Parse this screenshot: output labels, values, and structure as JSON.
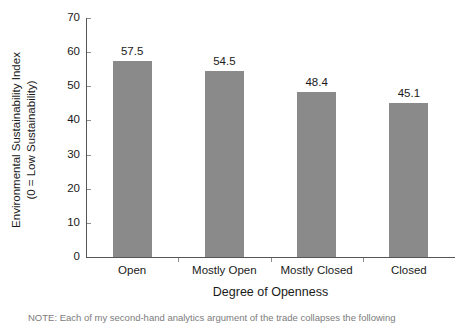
{
  "chart_data": {
    "type": "bar",
    "title": "",
    "categories": [
      "Open",
      "Mostly Open",
      "Mostly Closed",
      "Closed"
    ],
    "values": [
      57.5,
      54.5,
      48.4,
      45.1
    ],
    "value_labels": [
      "57.5",
      "54.5",
      "48.4",
      "45.1"
    ],
    "xlabel": "Degree of Openness",
    "ylabel_line1": "Environmental Sustainability Index",
    "ylabel_line2": "(0 = Low Sustainability)",
    "ylim": [
      0,
      70
    ],
    "yticks": [
      0,
      10,
      20,
      30,
      40,
      50,
      60,
      70
    ],
    "ytick_labels": [
      "0",
      "10",
      "20",
      "30",
      "40",
      "50",
      "60",
      "70"
    ],
    "grid": false,
    "legend": false,
    "bar_color": "#8a8a8a",
    "axis_color": "#555555",
    "background": "#ffffff"
  },
  "caption": {
    "text": "NOTE: Each of my second-hand analytics argument of the trade collapses the following"
  }
}
